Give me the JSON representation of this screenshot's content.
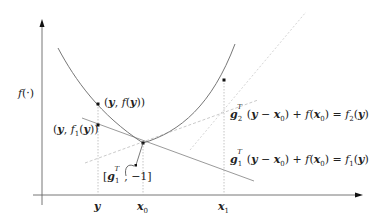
{
  "figure": {
    "axes": {
      "y_label": "f(·)",
      "x_ticks": [
        {
          "label": "y",
          "x": 98
        },
        {
          "label": "x0",
          "x": 143
        },
        {
          "label": "x1",
          "x": 224
        }
      ]
    },
    "points": [
      {
        "name": "(y, f(y))",
        "label_html": "(<b><i>y</i></b>, <i>f</i>(<b><i>y</i></b>))"
      },
      {
        "name": "(y, f1(y))",
        "label_html": "(<b><i>y</i></b>, <i>f</i><sub>1</sub>(<b><i>y</i></b>))"
      }
    ],
    "annotations": {
      "subgradient_vector": "[g1^T, -1]",
      "tangent_1": "g1^T(y - x0) + f(x0) = f1(y)",
      "tangent_2": "g2^T(y - x0) + f(x0) = f2(y)"
    },
    "colors": {
      "axis": "#555555",
      "curve": "#777777",
      "tangent_solid": "#8a8a8a",
      "tangent_dashed": "#bdbdbd",
      "guide": "#aaaaaa",
      "point": "#111111"
    }
  }
}
